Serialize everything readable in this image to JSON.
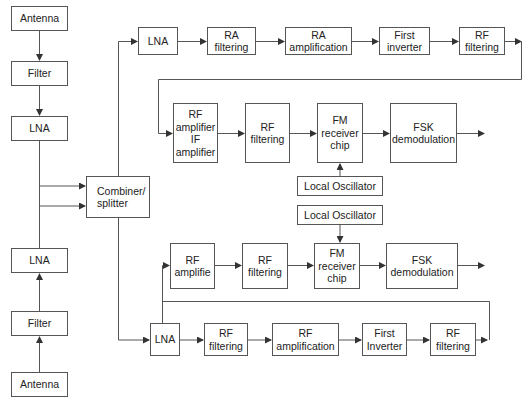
{
  "diagram": {
    "type": "block-diagram",
    "title": "",
    "stroke_color": "#555555",
    "background": "#ffffff",
    "nodes": [
      {
        "id": "antenna_top",
        "label": "Antenna",
        "x": 11,
        "y": 6,
        "w": 57,
        "h": 25
      },
      {
        "id": "filter_top",
        "label": "Filter",
        "x": 11,
        "y": 61,
        "w": 57,
        "h": 25
      },
      {
        "id": "lna_top",
        "label": "LNA",
        "x": 11,
        "y": 116,
        "w": 57,
        "h": 25
      },
      {
        "id": "combiner",
        "label": "Combiner/\nsplitter",
        "x": 86,
        "y": 176,
        "w": 64,
        "h": 42,
        "align": "left"
      },
      {
        "id": "lna_b1",
        "label": "LNA",
        "x": 138,
        "y": 27,
        "w": 40,
        "h": 28
      },
      {
        "id": "ra_filtering",
        "label": "RA\nfiltering",
        "x": 207,
        "y": 27,
        "w": 49,
        "h": 28
      },
      {
        "id": "ra_amplification",
        "label": "RA\namplification",
        "x": 285,
        "y": 27,
        "w": 67,
        "h": 28
      },
      {
        "id": "first_inverter_b1",
        "label": "First\ninverter",
        "x": 379,
        "y": 27,
        "w": 51,
        "h": 28
      },
      {
        "id": "rf_filtering_b1",
        "label": "RF\nfiltering",
        "x": 459,
        "y": 27,
        "w": 46,
        "h": 28
      },
      {
        "id": "rf_if_amplifier",
        "label": "RF\namplifier\nIF\namplifier",
        "x": 173,
        "y": 103,
        "w": 45,
        "h": 60
      },
      {
        "id": "rf_filtering_b1b",
        "label": "RF\nfiltering",
        "x": 245,
        "y": 103,
        "w": 45,
        "h": 60
      },
      {
        "id": "fm_chip_b1",
        "label": "FM\nreceiver\nchip",
        "x": 317,
        "y": 103,
        "w": 46,
        "h": 60
      },
      {
        "id": "fsk_demod_b1",
        "label": "FSK\ndemodulation",
        "x": 390,
        "y": 103,
        "w": 67,
        "h": 60
      },
      {
        "id": "local_osc_b1",
        "label": "Local Oscillator",
        "x": 297,
        "y": 176,
        "w": 86,
        "h": 20
      },
      {
        "id": "local_osc_b2",
        "label": "Local Oscillator",
        "x": 297,
        "y": 205,
        "w": 86,
        "h": 20
      },
      {
        "id": "rf_amplifie_b2",
        "label": "RF\namplifie",
        "x": 170,
        "y": 243,
        "w": 45,
        "h": 46
      },
      {
        "id": "rf_filtering_b2",
        "label": "RF\nfiltering",
        "x": 242,
        "y": 243,
        "w": 46,
        "h": 46
      },
      {
        "id": "fm_chip_b2",
        "label": "FM\nreceiver\nchip",
        "x": 314,
        "y": 243,
        "w": 46,
        "h": 46
      },
      {
        "id": "fsk_demod_b2",
        "label": "FSK\ndemodulation",
        "x": 386,
        "y": 243,
        "w": 72,
        "h": 46
      },
      {
        "id": "lna_bottom_branch",
        "label": "LNA",
        "x": 150,
        "y": 323,
        "w": 30,
        "h": 33
      },
      {
        "id": "rf_filtering_b3",
        "label": "RF\nfiltering",
        "x": 204,
        "y": 323,
        "w": 44,
        "h": 33
      },
      {
        "id": "rf_amplification_b3",
        "label": "RF\namplification",
        "x": 272,
        "y": 323,
        "w": 67,
        "h": 33
      },
      {
        "id": "first_inverter_b3",
        "label": "First\nInverter",
        "x": 362,
        "y": 323,
        "w": 45,
        "h": 33
      },
      {
        "id": "rf_filtering_b3b",
        "label": "RF\nfiltering",
        "x": 430,
        "y": 323,
        "w": 46,
        "h": 33
      },
      {
        "id": "lna_lower",
        "label": "LNA",
        "x": 11,
        "y": 248,
        "w": 57,
        "h": 25
      },
      {
        "id": "filter_lower",
        "label": "Filter",
        "x": 11,
        "y": 311,
        "w": 57,
        "h": 25
      },
      {
        "id": "antenna_lower",
        "label": "Antenna",
        "x": 11,
        "y": 372,
        "w": 57,
        "h": 25
      }
    ],
    "edges": [
      {
        "from": "antenna_top",
        "to": "filter_top"
      },
      {
        "from": "filter_top",
        "to": "lna_top"
      },
      {
        "from": "lna_top",
        "to": "combiner"
      },
      {
        "from": "lna_lower",
        "to": "combiner"
      },
      {
        "from": "filter_lower",
        "to": "lna_lower"
      },
      {
        "from": "antenna_lower",
        "to": "filter_lower"
      },
      {
        "from": "combiner",
        "to": "lna_b1"
      },
      {
        "from": "lna_b1",
        "to": "ra_filtering"
      },
      {
        "from": "ra_filtering",
        "to": "ra_amplification"
      },
      {
        "from": "ra_amplification",
        "to": "first_inverter_b1"
      },
      {
        "from": "first_inverter_b1",
        "to": "rf_filtering_b1"
      },
      {
        "from": "rf_filtering_b1",
        "to": "rf_if_amplifier"
      },
      {
        "from": "rf_if_amplifier",
        "to": "rf_filtering_b1b"
      },
      {
        "from": "rf_filtering_b1b",
        "to": "fm_chip_b1"
      },
      {
        "from": "fm_chip_b1",
        "to": "fsk_demod_b1"
      },
      {
        "from": "local_osc_b1",
        "to": "fm_chip_b1"
      },
      {
        "from": "fsk_demod_b1",
        "to": "output_1"
      },
      {
        "from": "combiner",
        "to": "lna_bottom_branch"
      },
      {
        "from": "lna_bottom_branch",
        "to": "rf_filtering_b3"
      },
      {
        "from": "rf_filtering_b3",
        "to": "rf_amplification_b3"
      },
      {
        "from": "rf_amplification_b3",
        "to": "first_inverter_b3"
      },
      {
        "from": "first_inverter_b3",
        "to": "rf_filtering_b3b"
      },
      {
        "from": "rf_filtering_b3b",
        "to": "rf_amplifie_b2"
      },
      {
        "from": "rf_amplifie_b2",
        "to": "rf_filtering_b2"
      },
      {
        "from": "rf_filtering_b2",
        "to": "fm_chip_b2"
      },
      {
        "from": "local_osc_b2",
        "to": "fm_chip_b2"
      },
      {
        "from": "fm_chip_b2",
        "to": "fsk_demod_b2"
      },
      {
        "from": "fsk_demod_b2",
        "to": "output_2"
      }
    ]
  }
}
